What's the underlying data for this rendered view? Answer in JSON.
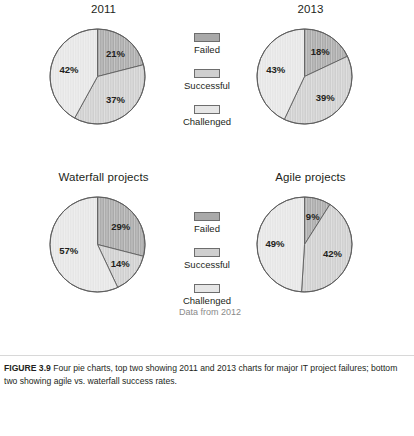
{
  "figure": {
    "caption_label": "FIGURE 3.9",
    "caption_text": " Four pie charts, top two showing 2011 and 2013 charts for major IT project failures; bottom two showing agile vs. waterfall success rates.",
    "data_note": "Data from 2012"
  },
  "legend_top": {
    "items": [
      {
        "label": "Failed",
        "color": "#a9a9a9"
      },
      {
        "label": "Successful",
        "color": "#cfcfcf"
      },
      {
        "label": "Challenged",
        "color": "#e6e6e6"
      }
    ]
  },
  "legend_bottom": {
    "items": [
      {
        "label": "Failed",
        "color": "#a9a9a9"
      },
      {
        "label": "Successful",
        "color": "#cfcfcf"
      },
      {
        "label": "Challenged",
        "color": "#e6e6e6"
      }
    ]
  },
  "chart_data": [
    {
      "type": "pie",
      "title": "2011",
      "labels": [
        "Failed",
        "Successful",
        "Challenged"
      ],
      "values": [
        21,
        37,
        42
      ],
      "value_labels": [
        "21%",
        "37%",
        "42%"
      ],
      "colors": [
        "#a9a9a9",
        "#cfcfcf",
        "#e6e6e6"
      ],
      "start_angle": 0,
      "legend": "right",
      "grid": false
    },
    {
      "type": "pie",
      "title": "2013",
      "labels": [
        "Failed",
        "Successful",
        "Challenged"
      ],
      "values": [
        18,
        39,
        43
      ],
      "value_labels": [
        "18%",
        "39%",
        "43%"
      ],
      "colors": [
        "#a9a9a9",
        "#cfcfcf",
        "#e6e6e6"
      ],
      "start_angle": 0,
      "legend": "left",
      "grid": false
    },
    {
      "type": "pie",
      "title": "Waterfall projects",
      "labels": [
        "Failed",
        "Successful",
        "Challenged"
      ],
      "values": [
        29,
        14,
        57
      ],
      "value_labels": [
        "29%",
        "14%",
        "57%"
      ],
      "colors": [
        "#a9a9a9",
        "#cfcfcf",
        "#e6e6e6"
      ],
      "start_angle": 0,
      "legend": "right",
      "grid": false
    },
    {
      "type": "pie",
      "title": "Agile projects",
      "labels": [
        "Failed",
        "Successful",
        "Challenged"
      ],
      "values": [
        9,
        42,
        49
      ],
      "value_labels": [
        "9%",
        "42%",
        "49%"
      ],
      "colors": [
        "#a9a9a9",
        "#cfcfcf",
        "#e6e6e6"
      ],
      "start_angle": 0,
      "legend": "left",
      "grid": false
    }
  ]
}
